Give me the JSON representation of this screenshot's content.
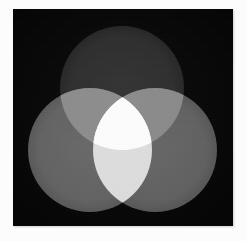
{
  "image": {
    "title": "Additive mixing of three overlapping light discs",
    "subject": "three-circle-venn-of-light",
    "width_px": 247,
    "height_px": 241,
    "capture_note": "grayscale photograph of three projected discs on a black backdrop"
  },
  "canvas": {
    "page_background": "#fcfcfc",
    "panel": {
      "x": 13,
      "y": 9,
      "width": 220,
      "height": 217,
      "background_color": "#050505",
      "label": "black backdrop"
    }
  },
  "palette": {
    "backdrop": "#050505",
    "disc_top": "#2b2b2b",
    "disc_left": "#616161",
    "disc_right": "#5f5f5f",
    "overlap_top_left": "#8a8a8a",
    "overlap_top_right": "#888888",
    "overlap_left_right": "#dcdcdc",
    "overlap_all_three": "#fcfcfc",
    "page_margin": "#fcfcfc"
  },
  "circles": [
    {
      "id": "top",
      "label": "upper disc",
      "cx": 109,
      "cy": 79,
      "r": 62,
      "fill": "#2b2b2b",
      "relative_brightness": "darkest"
    },
    {
      "id": "left",
      "label": "lower-left disc",
      "cx": 77,
      "cy": 141,
      "r": 62,
      "fill": "#616161",
      "relative_brightness": "medium"
    },
    {
      "id": "right",
      "label": "lower-right disc",
      "cx": 142,
      "cy": 141,
      "r": 62,
      "fill": "#5f5f5f",
      "relative_brightness": "medium"
    }
  ],
  "overlaps": [
    {
      "id": "top-left",
      "members": [
        "top",
        "left"
      ],
      "fill": "#8a8a8a",
      "label": "upper and lower-left intersection"
    },
    {
      "id": "top-right",
      "members": [
        "top",
        "right"
      ],
      "fill": "#888888",
      "label": "upper and lower-right intersection"
    },
    {
      "id": "left-right",
      "members": [
        "left",
        "right"
      ],
      "fill": "#dcdcdc",
      "label": "lower-left and lower-right intersection"
    },
    {
      "id": "all-three",
      "members": [
        "top",
        "left",
        "right"
      ],
      "fill": "#fcfcfc",
      "label": "central three-way intersection"
    }
  ],
  "accessibility": {
    "alt_text": "Three large overlapping circles of light on a black background arranged in a triangle: one at the top and two below. Where two circles overlap the area is brighter, and the small central region where all three overlap is pure white."
  }
}
